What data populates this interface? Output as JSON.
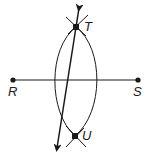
{
  "diagram": {
    "type": "geometric-construction",
    "colors": {
      "stroke": "#1a1a1a",
      "background": "#ffffff"
    },
    "points": [
      {
        "id": "R",
        "label": "R",
        "x": 13,
        "y": 80,
        "label_x": 8,
        "label_y": 96
      },
      {
        "id": "S",
        "label": "S",
        "x": 138,
        "y": 80,
        "label_x": 133,
        "label_y": 96
      },
      {
        "id": "T",
        "label": "T",
        "x": 76,
        "y": 27,
        "label_x": 84,
        "label_y": 31
      },
      {
        "id": "U",
        "label": "U",
        "x": 75,
        "y": 136,
        "label_x": 82,
        "label_y": 140
      }
    ],
    "segments": [
      {
        "id": "RS",
        "from": "R",
        "to": "S"
      }
    ],
    "rays": [
      {
        "id": "line-TU",
        "description": "Double-arrowed line through T and U",
        "x1": 79,
        "y1": 8,
        "x2": 57,
        "y2": 148
      }
    ],
    "arcs": [
      {
        "id": "arc-from-R",
        "description": "Arc centered at R, right side of lens"
      },
      {
        "id": "arc-from-S",
        "description": "Arc centered at S, left side of lens"
      }
    ]
  }
}
